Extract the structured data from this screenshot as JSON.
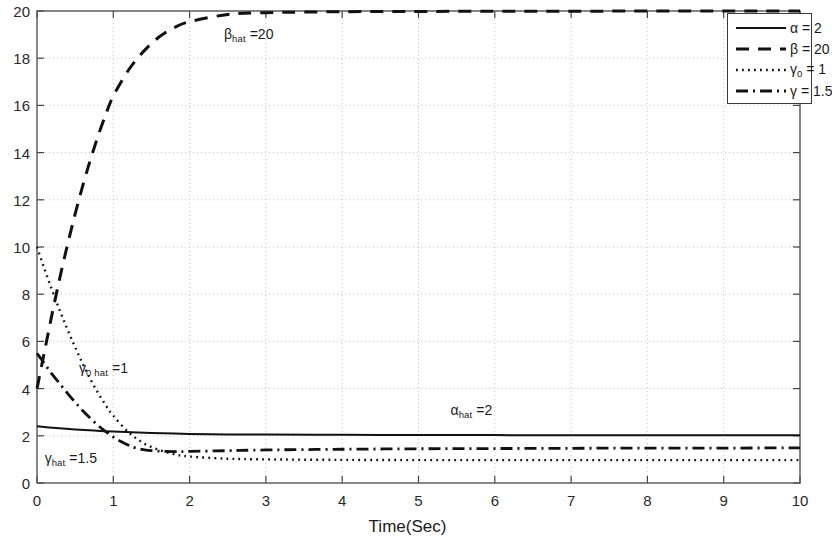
{
  "chart_data": {
    "type": "line",
    "title": "",
    "xlabel": "Time(Sec)",
    "ylabel": "",
    "xlim": [
      0,
      10
    ],
    "ylim": [
      0,
      20
    ],
    "xticks": [
      "0",
      "1",
      "2",
      "3",
      "4",
      "5",
      "6",
      "7",
      "8",
      "9",
      "10"
    ],
    "yticks": [
      "0",
      "2",
      "4",
      "6",
      "8",
      "10",
      "12",
      "14",
      "16",
      "18",
      "20"
    ],
    "grid": true,
    "grid_style": "dotted",
    "legend_position": "top-right",
    "series": [
      {
        "name": "alpha",
        "legend_label": "α = 2",
        "legend_sub": "",
        "style": "solid",
        "color": "#111111",
        "final_value": 2,
        "initial_value": 2.4,
        "x": [
          0,
          0.25,
          0.5,
          0.75,
          1,
          1.5,
          2,
          2.5,
          3,
          4,
          5,
          6,
          7,
          8,
          9,
          10
        ],
        "values": [
          2.4,
          2.33,
          2.27,
          2.22,
          2.18,
          2.12,
          2.08,
          2.06,
          2.05,
          2.04,
          2.03,
          2.03,
          2.02,
          2.02,
          2.02,
          2.02
        ]
      },
      {
        "name": "beta",
        "legend_label": "β = 20",
        "legend_sub": "",
        "style": "dashed",
        "color": "#111111",
        "final_value": 20,
        "initial_value": 4.0,
        "x": [
          0,
          0.1,
          0.2,
          0.3,
          0.4,
          0.5,
          0.6,
          0.7,
          0.8,
          0.9,
          1,
          1.2,
          1.4,
          1.6,
          1.8,
          2,
          2.5,
          3,
          4,
          5,
          6,
          7,
          8,
          9,
          10
        ],
        "values": [
          4.0,
          5.6,
          7.2,
          8.7,
          10.1,
          11.4,
          12.6,
          13.7,
          14.7,
          15.6,
          16.4,
          17.5,
          18.3,
          18.9,
          19.3,
          19.55,
          19.85,
          19.93,
          19.97,
          19.98,
          19.99,
          19.99,
          20,
          20,
          20
        ]
      },
      {
        "name": "gamma0",
        "legend_label": "γ",
        "legend_sub": "0",
        "legend_suffix": " = 1",
        "style": "dotted",
        "color": "#111111",
        "final_value": 1,
        "initial_value": 10.0,
        "x": [
          0,
          0.1,
          0.2,
          0.3,
          0.4,
          0.5,
          0.6,
          0.7,
          0.8,
          0.9,
          1,
          1.2,
          1.4,
          1.6,
          1.8,
          2,
          2.5,
          3,
          4,
          5,
          6,
          7,
          8,
          9,
          10
        ],
        "values": [
          10.0,
          9.05,
          8.15,
          7.3,
          6.5,
          5.75,
          5.05,
          4.4,
          3.82,
          3.3,
          2.85,
          2.15,
          1.68,
          1.4,
          1.22,
          1.12,
          1.03,
          1.0,
          0.98,
          0.97,
          0.97,
          0.97,
          0.97,
          0.97,
          0.97
        ]
      },
      {
        "name": "gamma",
        "legend_label": "γ = 1.5",
        "legend_sub": "",
        "style": "dashdot",
        "color": "#111111",
        "final_value": 1.5,
        "initial_value": 5.5,
        "x": [
          0,
          0.1,
          0.2,
          0.3,
          0.4,
          0.5,
          0.6,
          0.7,
          0.8,
          0.9,
          1,
          1.1,
          1.2,
          1.3,
          1.5,
          1.8,
          2,
          2.5,
          3,
          4,
          5,
          6,
          7,
          8,
          9,
          10
        ],
        "values": [
          5.5,
          5.05,
          4.6,
          4.2,
          3.8,
          3.42,
          3.06,
          2.74,
          2.44,
          2.18,
          1.95,
          1.76,
          1.6,
          1.48,
          1.37,
          1.33,
          1.34,
          1.37,
          1.4,
          1.43,
          1.45,
          1.46,
          1.47,
          1.48,
          1.48,
          1.49
        ]
      }
    ],
    "annotations": [
      {
        "name": "beta-hat-label",
        "base": "β",
        "sub": "hat",
        "suffix": " =20",
        "x": 2.45,
        "y": 19.0
      },
      {
        "name": "gamma0-hat-label",
        "base": "γ",
        "sub": "0 hat",
        "suffix": " =1",
        "x": 0.55,
        "y": 4.85
      },
      {
        "name": "alpha-hat-label",
        "base": "α",
        "sub": "hat",
        "suffix": " =2",
        "x": 5.42,
        "y": 3.05
      },
      {
        "name": "gamma-hat-label",
        "base": "γ",
        "sub": "hat",
        "suffix": " =1.5",
        "x": 0.1,
        "y": 1.02
      }
    ]
  },
  "axes": {
    "x_title": "Time(Sec)"
  }
}
